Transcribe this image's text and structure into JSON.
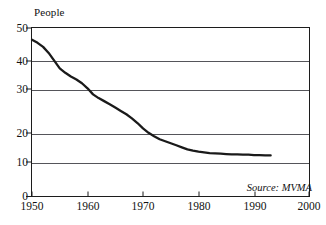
{
  "chart_data": {
    "type": "line",
    "title": "",
    "ylabel": "People",
    "xlabel": "",
    "xlim": [
      1950,
      2000
    ],
    "ylim": [
      0,
      50
    ],
    "grid": true,
    "legend": false,
    "y_ticks": [
      50,
      40,
      30,
      20,
      10,
      0
    ],
    "y_tick_labels": [
      "50",
      "40",
      "30",
      "20",
      "10",
      "0"
    ],
    "x_ticks": [
      1950,
      1960,
      1970,
      1980,
      1990,
      2000
    ],
    "x_tick_labels": [
      "1950",
      "1960",
      "1970",
      "1980",
      "1990",
      "2000"
    ],
    "annotations": [
      {
        "name": "source",
        "text": "Source: MVMA"
      }
    ],
    "series": [
      {
        "name": "People",
        "color": "#1a1a1a",
        "x": [
          1950,
          1951,
          1952,
          1953,
          1954,
          1955,
          1956,
          1957,
          1958,
          1959,
          1960,
          1961,
          1962,
          1963,
          1964,
          1965,
          1966,
          1967,
          1968,
          1969,
          1970,
          1971,
          1972,
          1973,
          1974,
          1975,
          1976,
          1977,
          1978,
          1979,
          1980,
          1981,
          1982,
          1983,
          1984,
          1985,
          1986,
          1987,
          1988,
          1989,
          1990,
          1991,
          1992,
          1993
        ],
        "values": [
          46.5,
          45.6,
          44.4,
          42.6,
          40.3,
          38.0,
          36.7,
          35.6,
          34.7,
          33.6,
          32.1,
          30.3,
          29.2,
          28.3,
          27.4,
          26.4,
          25.4,
          24.4,
          23.2,
          21.8,
          20.2,
          18.9,
          17.9,
          17.0,
          16.4,
          15.8,
          15.2,
          14.6,
          14.0,
          13.6,
          13.3,
          13.1,
          12.9,
          12.8,
          12.7,
          12.6,
          12.5,
          12.5,
          12.4,
          12.4,
          12.3,
          12.3,
          12.2,
          12.2
        ]
      }
    ]
  }
}
